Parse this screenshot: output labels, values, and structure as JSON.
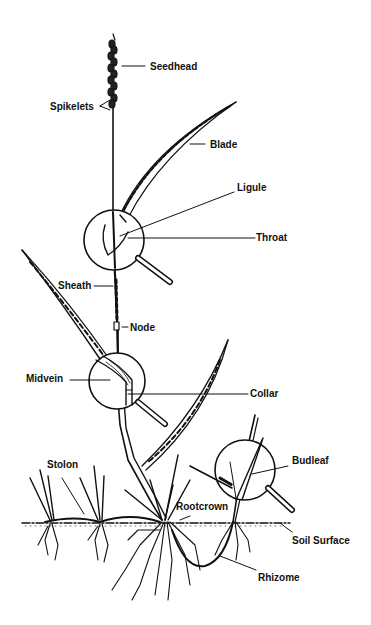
{
  "diagram": {
    "colors": {
      "ink": "#111111",
      "background": "#ffffff"
    },
    "labels": {
      "seedhead": "Seedhead",
      "spikelets": "Spikelets",
      "blade": "Blade",
      "ligule": "Ligule",
      "throat": "Throat",
      "sheath": "Sheath",
      "node": "Node",
      "midvein": "Midvein",
      "collar": "Collar",
      "stolon": "Stolon",
      "budleaf": "Budleaf",
      "rootcrown": "Rootcrown",
      "soil_surface": "Soil Surface",
      "rhizome": "Rhizome"
    },
    "magnifiers": [
      {
        "name": "throat-ligule-magnifier"
      },
      {
        "name": "collar-midvein-magnifier"
      },
      {
        "name": "budleaf-magnifier"
      }
    ]
  }
}
